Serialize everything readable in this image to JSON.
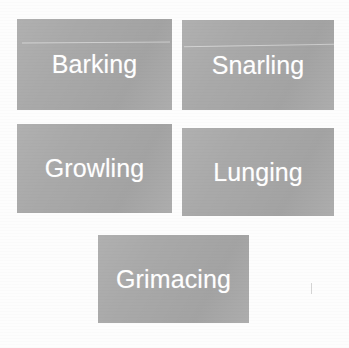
{
  "page": {
    "background_color": "#fdfdfd"
  },
  "style": {
    "box_fill_color": "#a9a9a9",
    "label_text_color": "#ffffff"
  },
  "diagram": {
    "type": "box-grid",
    "layout": "2-2-1",
    "boxes": [
      {
        "id": "barking",
        "label": "Barking",
        "row": 1,
        "column": 1
      },
      {
        "id": "snarling",
        "label": "Snarling",
        "row": 1,
        "column": 2
      },
      {
        "id": "growling",
        "label": "Growling",
        "row": 2,
        "column": 1
      },
      {
        "id": "lunging",
        "label": "Lunging",
        "row": 2,
        "column": 2
      },
      {
        "id": "grimacing",
        "label": "Grimacing",
        "row": 3,
        "column": 1
      }
    ]
  }
}
